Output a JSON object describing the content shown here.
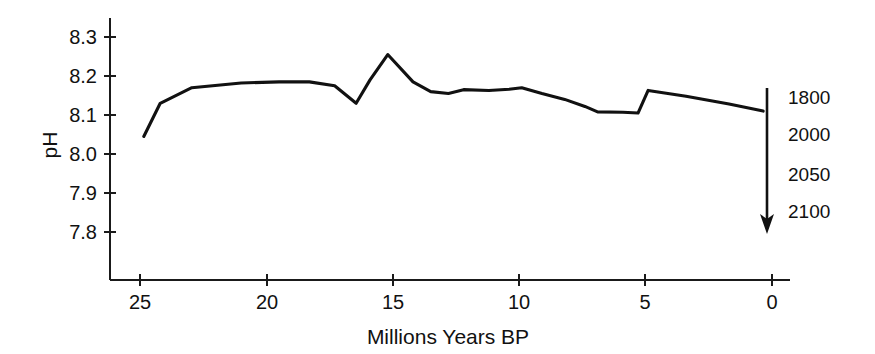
{
  "chart_data": {
    "type": "line",
    "title": "",
    "xlabel": "Millions Years BP",
    "ylabel": "pH",
    "xlim": [
      26.3,
      -1.1
    ],
    "ylim": [
      7.73,
      8.34
    ],
    "x_ticks": [
      25,
      20,
      15,
      10,
      5,
      0
    ],
    "y_ticks": [
      "8.3",
      "8.2",
      "8.1",
      "8.0",
      "7.9",
      "7.8"
    ],
    "grid": false,
    "legend": "none",
    "x_axis_direction": "reversed",
    "series": [
      {
        "name": "Ocean surface pH",
        "x": [
          24.85,
          24.2,
          22.95,
          21.0,
          19.5,
          18.3,
          17.3,
          16.45,
          15.9,
          15.2,
          14.2,
          13.5,
          12.8,
          12.2,
          11.2,
          10.4,
          9.9,
          9.1,
          8.2,
          7.4,
          6.9,
          5.9,
          5.3,
          4.9,
          3.4,
          1.7,
          0.35
        ],
        "y": [
          8.045,
          8.13,
          8.17,
          8.182,
          8.185,
          8.185,
          8.175,
          8.13,
          8.19,
          8.255,
          8.185,
          8.16,
          8.155,
          8.165,
          8.163,
          8.166,
          8.17,
          8.155,
          8.14,
          8.122,
          8.108,
          8.107,
          8.105,
          8.163,
          8.148,
          8.128,
          8.11
        ]
      }
    ],
    "projection_arrow": {
      "description": "downward arrow marking future ocean acidification",
      "labels": [
        "1800",
        "2000",
        "2050",
        "2100"
      ]
    },
    "colors": {
      "line": "#111111",
      "axis": "#1a1a1a",
      "background": "#ffffff",
      "text": "#111111"
    }
  }
}
